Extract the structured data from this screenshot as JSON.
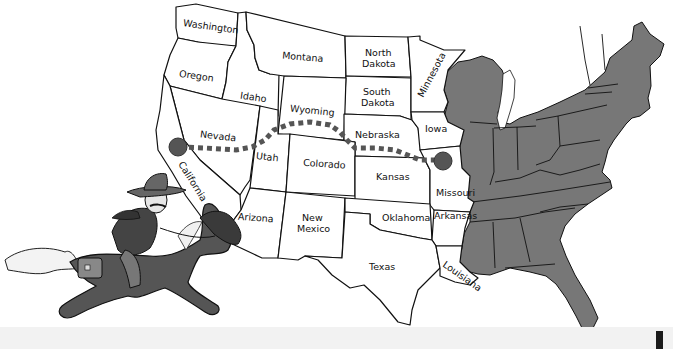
{
  "map": {
    "subject": "Pony Express route across the western United States",
    "colors": {
      "western_states_fill": "#ffffff",
      "eastern_states_fill": "#777777",
      "outline": "#111111",
      "route": "#555555",
      "route_endpoints": "#555555",
      "bottom_band": "#f2f2f2"
    },
    "state_labels": {
      "washington": "Washington",
      "oregon": "Oregon",
      "california": "California",
      "nevada": "Nevada",
      "idaho": "Idaho",
      "montana": "Montana",
      "wyoming": "Wyoming",
      "utah": "Utah",
      "arizona": "Arizona",
      "colorado": "Colorado",
      "new_mexico_1": "New",
      "new_mexico_2": "Mexico",
      "north_dakota_1": "North",
      "north_dakota_2": "Dakota",
      "south_dakota_1": "South",
      "south_dakota_2": "Dakota",
      "nebraska": "Nebraska",
      "kansas": "Kansas",
      "oklahoma": "Oklahoma",
      "texas": "Texas",
      "minnesota": "Minnesota",
      "iowa": "Iowa",
      "missouri": "Missouri",
      "arkansas": "Arkansas",
      "louisiana": "Louisiana"
    },
    "route": {
      "start_marker": "California (west endpoint)",
      "end_marker": "Missouri (east endpoint)"
    },
    "illustration": "pony-express-rider-on-galloping-horse"
  }
}
